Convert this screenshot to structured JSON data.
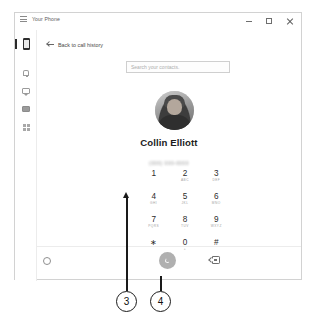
{
  "window": {
    "title": "Your Phone",
    "menu_icon": "hamburger-icon",
    "controls": {
      "minimize": "–",
      "maximize": "□",
      "close": "✕"
    }
  },
  "sidebar": {
    "items": [
      {
        "label": "Phone",
        "icon": "phone-icon",
        "selected": true
      },
      {
        "label": "Notifications",
        "icon": "bell-icon",
        "selected": false
      },
      {
        "label": "Messages",
        "icon": "message-icon",
        "selected": false
      },
      {
        "label": "Photos",
        "icon": "photo-icon",
        "selected": false
      },
      {
        "label": "Apps",
        "icon": "apps-grid-icon",
        "selected": false
      }
    ],
    "settings": {
      "label": "Settings",
      "icon": "gear-icon"
    }
  },
  "main": {
    "back_link": "Back to call history",
    "back_icon": "back-arrow-icon",
    "search": {
      "placeholder": "Search your contacts.",
      "value": ""
    },
    "contact": {
      "name": "Collin Elliott",
      "number": "(000) 000-0000",
      "avatar": "contact-avatar"
    }
  },
  "dialpad": {
    "keys": [
      {
        "digit": "1",
        "letters": ""
      },
      {
        "digit": "2",
        "letters": "ABC"
      },
      {
        "digit": "3",
        "letters": "DEF"
      },
      {
        "digit": "4",
        "letters": "GHI"
      },
      {
        "digit": "5",
        "letters": "JKL"
      },
      {
        "digit": "6",
        "letters": "MNO"
      },
      {
        "digit": "7",
        "letters": "PQRS"
      },
      {
        "digit": "8",
        "letters": "TUV"
      },
      {
        "digit": "9",
        "letters": "WXYZ"
      },
      {
        "digit": "∗",
        "letters": ""
      },
      {
        "digit": "0",
        "letters": "+"
      },
      {
        "digit": "#",
        "letters": ""
      }
    ]
  },
  "actions": {
    "call": {
      "label": "Call",
      "icon": "phone-handset-icon",
      "enabled": false
    },
    "backspace": {
      "label": "Backspace",
      "icon": "backspace-icon"
    }
  },
  "callouts": [
    {
      "number": "3",
      "points_to": "dialpad-key-7"
    },
    {
      "number": "4",
      "points_to": "call-button"
    }
  ],
  "colors": {
    "call_button": "#b0b0b0",
    "text_primary": "#1c1c1c",
    "text_muted": "#a3a3a3",
    "window_border": "#d2d2d2",
    "callout": "#1a1a1a"
  }
}
